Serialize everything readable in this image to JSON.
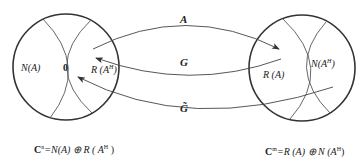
{
  "diagram": {
    "left_space": {
      "regions": {
        "null_space": "N(A)",
        "zero": "0",
        "range_adjoint": "R (A",
        "range_adjoint_sup": "H",
        "range_adjoint_close": ")"
      },
      "formula": {
        "prefix": "C",
        "sup": "n",
        "rest": "=N(A) ⊕ R ( A",
        "rest_sup": "H",
        "close": " )"
      }
    },
    "right_space": {
      "regions": {
        "range": "R (A)",
        "null_space_adjoint": "N(A",
        "null_space_adjoint_sup": "H",
        "null_space_adjoint_close": ")"
      },
      "formula": {
        "prefix": "C",
        "sup": "m",
        "rest": "=R (A) ⊕ N (A",
        "rest_sup": "H",
        "close": ")"
      }
    },
    "mappings": [
      {
        "label": "A",
        "direction": "left-to-right"
      },
      {
        "label": "G",
        "direction": "right-to-left"
      },
      {
        "label": "G̃",
        "direction": "right-to-left"
      }
    ]
  }
}
